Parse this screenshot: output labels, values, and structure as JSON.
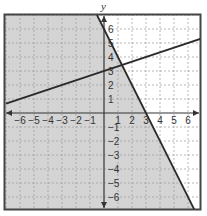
{
  "chart_data": {
    "type": "line",
    "title": "",
    "xlabel": "x",
    "ylabel": "y",
    "xlim": [
      -7,
      7
    ],
    "ylim": [
      -7,
      7
    ],
    "grid": true,
    "x_ticks": [
      -6,
      -5,
      -4,
      -3,
      -2,
      -1,
      1,
      2,
      3,
      4,
      5,
      6
    ],
    "y_ticks": [
      6,
      5,
      4,
      3,
      2,
      1,
      -1,
      -2,
      -3,
      -4,
      -5,
      -6
    ],
    "x_tick_labels": [
      "−6",
      "−5",
      "−4",
      "−3",
      "−2",
      "−1",
      "1",
      "2",
      "3",
      "4",
      "5",
      "6"
    ],
    "y_tick_labels": [
      "6",
      "5",
      "4",
      "3",
      "2",
      "1",
      "−1",
      "−2",
      "−3",
      "−4",
      "−5",
      "−6"
    ],
    "series": [
      {
        "name": "line-1",
        "equation": "y = -2x + 6",
        "slope": -2,
        "intercept": 6,
        "x": [
          -0.5,
          6.5
        ],
        "y": [
          7,
          -7
        ],
        "color": "#2a2a2a"
      },
      {
        "name": "line-2",
        "equation": "y = (1/3)x + 3",
        "slope": 0.3333,
        "intercept": 3,
        "x": [
          -7,
          7
        ],
        "y": [
          0.667,
          5.333
        ],
        "color": "#2a2a2a"
      }
    ],
    "shaded_region": {
      "inequality": "y <= -2x + 6",
      "side": "left of line-1",
      "color": "#d4d4d4"
    },
    "intersection": {
      "x": 1.29,
      "y": 3.43
    }
  },
  "colors": {
    "shade": "#d4d4d4",
    "grid": "#9a9a9a",
    "line": "#2a2a2a",
    "frame": "#444444",
    "axis": "#333333"
  }
}
